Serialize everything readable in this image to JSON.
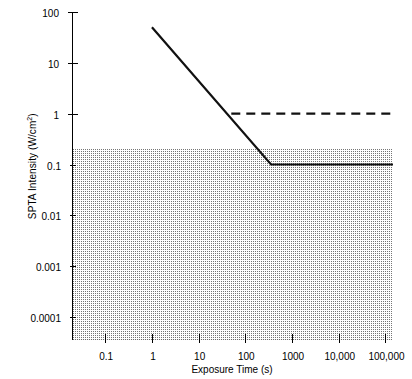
{
  "chart_data": {
    "type": "line",
    "title": "",
    "xlabel": "Exposure Time (s)",
    "ylabel_text": "SPTA Intensity (W/cm",
    "ylabel_sup": "2",
    "ylabel_tail": ")",
    "ylabel_full": "SPTA Intensity (W/cm2)",
    "xscale": "log",
    "yscale": "log",
    "xlim": [
      0.0204,
      145000
    ],
    "ylim": [
      3.53e-05,
      100
    ],
    "grid": false,
    "legend": "none",
    "xticks": [
      {
        "value": 0.1,
        "label": "0.1"
      },
      {
        "value": 1,
        "label": "1"
      },
      {
        "value": 10,
        "label": "10"
      },
      {
        "value": 100,
        "label": "100"
      },
      {
        "value": 1000,
        "label": "1000"
      },
      {
        "value": 10000,
        "label": "10,000"
      },
      {
        "value": 100000,
        "label": "100,000"
      }
    ],
    "yticks": [
      {
        "value": 100,
        "label": "100",
        "minor": false
      },
      {
        "value": 10,
        "label": "10",
        "minor": false
      },
      {
        "value": 1,
        "label": "1",
        "minor": false
      },
      {
        "value": 0.1,
        "label": "0.1",
        "minor": true
      },
      {
        "value": 0.01,
        "label": "0.01",
        "minor": true
      },
      {
        "value": 0.001,
        "label": "0.001",
        "minor": true
      },
      {
        "value": 0.0001,
        "label": "0.0001",
        "minor": true
      }
    ],
    "shaded_region": {
      "name": "non-thermal-safe-zone",
      "style": "stippled-gray",
      "color": "#6f6f6f",
      "y_top": 0.2,
      "y_bottom": 3.53e-05,
      "x_from": 0.0204,
      "x_to": 145000
    },
    "series": [
      {
        "name": "Thermal threshold (solid)",
        "style": "solid",
        "color": "#111111",
        "points": [
          {
            "x": 1.0,
            "y": 50.0
          },
          {
            "x": 355.0,
            "y": 0.1
          },
          {
            "x": 145000.0,
            "y": 0.1
          }
        ]
      },
      {
        "name": "Limit (dashed)",
        "style": "dashed",
        "color": "#111111",
        "points": [
          {
            "x": 50.0,
            "y": 1.0
          },
          {
            "x": 145000.0,
            "y": 1.0
          }
        ]
      }
    ]
  }
}
